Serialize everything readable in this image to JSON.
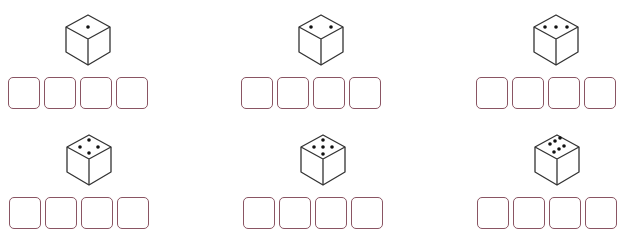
{
  "worksheet": {
    "box_color": "#8a5563",
    "cube_stroke": "#333333",
    "items": [
      {
        "die_value": 1,
        "boxes": [
          "",
          "",
          "",
          ""
        ],
        "pos": [
          8,
          0
        ]
      },
      {
        "die_value": 2,
        "boxes": [
          "",
          "",
          "",
          ""
        ],
        "pos": [
          241,
          0
        ]
      },
      {
        "die_value": 3,
        "boxes": [
          "",
          "",
          "",
          ""
        ],
        "pos": [
          476,
          0
        ]
      },
      {
        "die_value": 4,
        "boxes": [
          "",
          "",
          "",
          ""
        ],
        "pos": [
          9,
          120
        ]
      },
      {
        "die_value": 5,
        "boxes": [
          "",
          "",
          "",
          ""
        ],
        "pos": [
          243,
          120
        ]
      },
      {
        "die_value": 6,
        "boxes": [
          "",
          "",
          "",
          ""
        ],
        "pos": [
          477,
          120
        ]
      }
    ]
  }
}
